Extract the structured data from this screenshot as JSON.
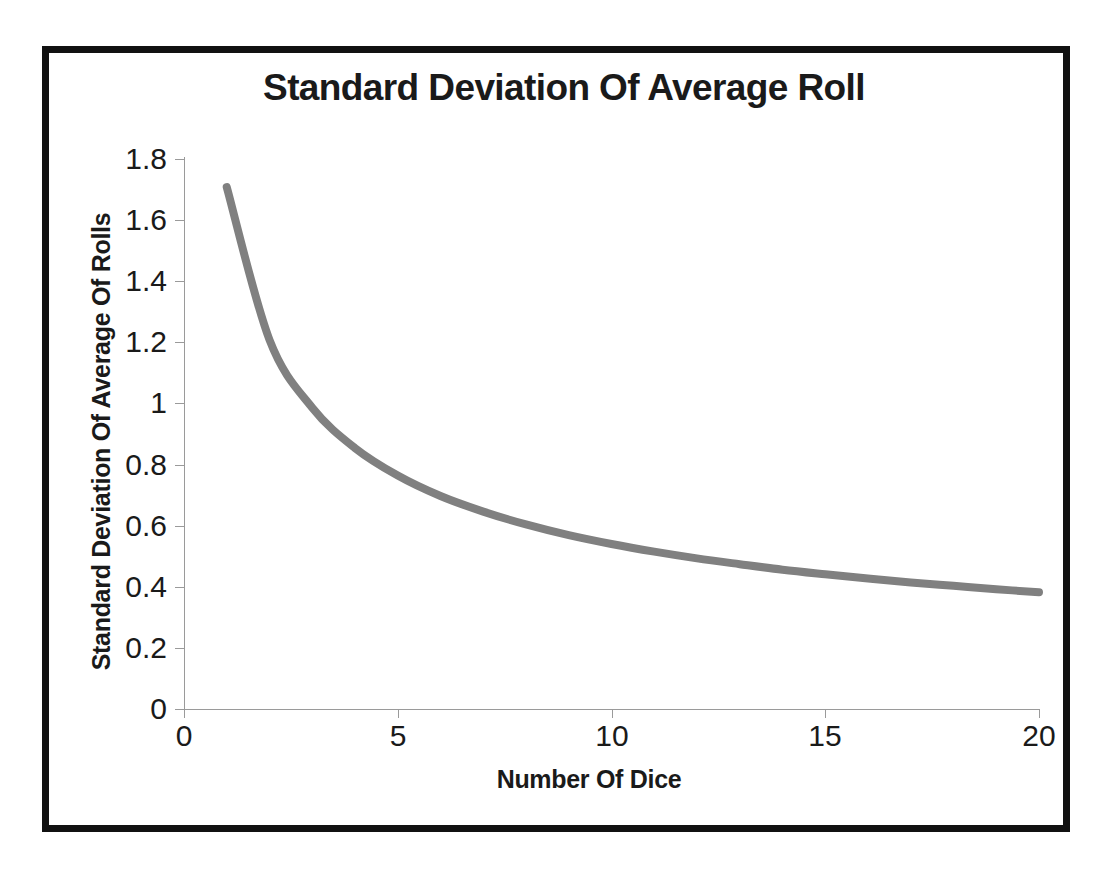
{
  "figure": {
    "frame_color": "#111111",
    "background": "#ffffff"
  },
  "chart_data": {
    "type": "line",
    "title": "Standard Deviation Of Average Roll",
    "xlabel": "Number Of Dice",
    "ylabel": "Standard Deviation Of Average Of Rolls",
    "grid": false,
    "legend": null,
    "xlim": [
      0,
      20
    ],
    "ylim": [
      0,
      1.8
    ],
    "xticks": [
      0,
      5,
      10,
      15,
      20
    ],
    "xtick_labels": [
      "0",
      "5",
      "10",
      "15",
      "20"
    ],
    "yticks": [
      0,
      0.2,
      0.4,
      0.6,
      0.8,
      1,
      1.2,
      1.4,
      1.6,
      1.8
    ],
    "ytick_labels": [
      "0",
      "0.2",
      "0.4",
      "0.6",
      "0.8",
      "1",
      "1.2",
      "1.4",
      "1.6",
      "1.8"
    ],
    "series": [
      {
        "name": "Standard Deviation Of Average Roll",
        "color": "#808080",
        "line_width": 8,
        "x": [
          1,
          2,
          3,
          4,
          5,
          6,
          7,
          8,
          9,
          10,
          11,
          12,
          13,
          14,
          15,
          16,
          17,
          18,
          19,
          20
        ],
        "values": [
          1.708,
          1.208,
          0.986,
          0.854,
          0.764,
          0.697,
          0.646,
          0.604,
          0.569,
          0.54,
          0.515,
          0.493,
          0.474,
          0.456,
          0.441,
          0.427,
          0.414,
          0.403,
          0.392,
          0.382
        ]
      }
    ]
  }
}
